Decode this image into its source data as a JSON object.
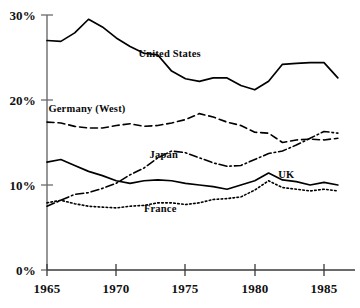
{
  "chart_data": {
    "type": "line",
    "title": "",
    "xlabel": "",
    "ylabel": "",
    "xlim": [
      1965,
      1986
    ],
    "ylim": [
      0,
      30
    ],
    "grid": false,
    "legend_position": "inline-annotations",
    "x_tick_labels": [
      "1965",
      "1970",
      "1975",
      "1980",
      "1985"
    ],
    "x_tick_values": [
      1965,
      1970,
      1975,
      1980,
      1985
    ],
    "y_tick_labels": [
      "0%",
      "10%",
      "20%",
      "30%"
    ],
    "y_tick_values": [
      0,
      10,
      20,
      30
    ],
    "x": [
      1965,
      1966,
      1967,
      1968,
      1969,
      1970,
      1971,
      1972,
      1973,
      1974,
      1975,
      1976,
      1977,
      1978,
      1979,
      1980,
      1981,
      1982,
      1983,
      1984,
      1985,
      1986
    ],
    "series": [
      {
        "name": "United States",
        "line_style": "solid",
        "label": "United States",
        "label_x": 1971.6,
        "label_y": 25.3,
        "values": [
          27.0,
          26.9,
          27.9,
          29.5,
          28.6,
          27.3,
          26.3,
          25.5,
          25.3,
          23.4,
          22.5,
          22.2,
          22.6,
          22.6,
          21.7,
          21.2,
          22.2,
          24.2,
          24.3,
          24.4,
          24.4,
          22.6
        ]
      },
      {
        "name": "Germany (West)",
        "line_style": "dashed",
        "label": "Germany (West)",
        "label_x": 1965.1,
        "label_y": 18.8,
        "values": [
          17.4,
          17.3,
          16.9,
          16.7,
          16.7,
          17.0,
          17.2,
          16.9,
          17.0,
          17.3,
          17.7,
          18.4,
          18.0,
          17.4,
          17.0,
          16.2,
          16.1,
          15.0,
          15.3,
          15.4,
          15.3,
          15.5
        ]
      },
      {
        "name": "Japan",
        "line_style": "dashdot",
        "label": "Japan",
        "label_x": 1972.4,
        "label_y": 13.4,
        "values": [
          7.5,
          8.2,
          8.9,
          9.1,
          9.6,
          10.2,
          11.2,
          12.0,
          13.2,
          14.0,
          13.8,
          13.2,
          12.6,
          12.2,
          12.3,
          13.0,
          13.7,
          14.0,
          14.7,
          15.5,
          16.3,
          16.1
        ]
      },
      {
        "name": "UK",
        "line_style": "solid",
        "label": "UK",
        "label_x": 1981.7,
        "label_y": 11.1,
        "values": [
          12.7,
          13.0,
          12.3,
          11.6,
          11.1,
          10.5,
          10.2,
          10.5,
          10.6,
          10.5,
          10.2,
          10.0,
          9.8,
          9.5,
          10.0,
          10.5,
          11.4,
          10.6,
          10.4,
          10.0,
          10.3,
          10.0
        ]
      },
      {
        "name": "France",
        "line_style": "dotted",
        "label": "France",
        "label_x": 1972.0,
        "label_y": 7.1,
        "values": [
          7.9,
          8.2,
          7.8,
          7.5,
          7.4,
          7.3,
          7.5,
          7.6,
          7.9,
          7.9,
          7.7,
          7.9,
          8.3,
          8.4,
          8.6,
          9.4,
          10.5,
          9.7,
          9.5,
          9.3,
          9.5,
          9.3
        ]
      }
    ],
    "colors": {
      "line": "#000000",
      "axis": "#555555",
      "text": "#000000",
      "background": "#ffffff"
    }
  },
  "axis": {
    "y_labels": [
      "30%",
      "20%",
      "10%",
      "0%"
    ],
    "x_labels": [
      "1965",
      "1970",
      "1975",
      "1980",
      "1985"
    ]
  },
  "annotations": {
    "united_states": "United States",
    "germany_west": "Germany (West)",
    "japan": "Japan",
    "uk": "UK",
    "france": "France"
  }
}
